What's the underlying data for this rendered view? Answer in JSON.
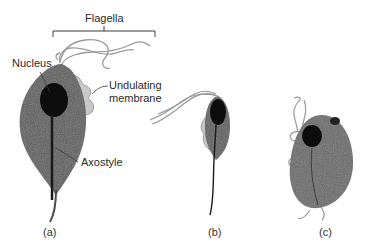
{
  "diagram": {
    "labels": {
      "flagella": "Flagella",
      "nucleus": "Nucleus",
      "undulating_membrane_line1": "Undulating",
      "undulating_membrane_line2": "membrane",
      "axostyle": "Axostyle"
    },
    "panels": [
      {
        "id": "a",
        "label": "(a)"
      },
      {
        "id": "b",
        "label": "(b)"
      },
      {
        "id": "c",
        "label": "(c)"
      }
    ],
    "colors": {
      "body": "#5e5e5e",
      "body_dark": "#4a4a4a",
      "nucleus": "#0d0d0d",
      "membrane": "#c8c8c8",
      "flagella": "#9a9a9a",
      "leader_line": "#3a3a3a"
    }
  }
}
